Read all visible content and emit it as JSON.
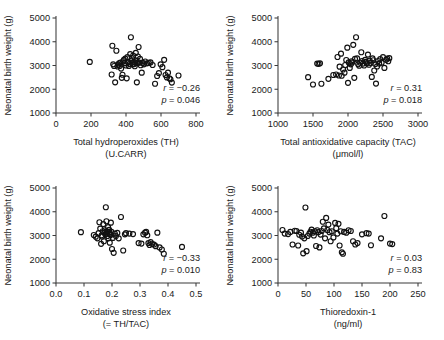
{
  "figure": {
    "background": "#ffffff",
    "marker_color": "#111111",
    "axis_color": "#3b3b3b",
    "shared_ylabel": "Neonatal birth weight (g)"
  },
  "chart_data": [
    {
      "type": "scatter",
      "panel_id": "panel-th",
      "title": "",
      "xlabel": "Total hydroperoxides (TH)",
      "xlabel_line2": "(U.CARR)",
      "ylabel": "Neonatal birth weight (g)",
      "xlim": [
        0,
        800
      ],
      "ylim": [
        1000,
        5000
      ],
      "xticks": [
        0,
        200,
        400,
        600,
        800
      ],
      "xtick_labels": [
        "0",
        "200",
        "400",
        "600",
        "800"
      ],
      "yticks": [
        1000,
        2000,
        3000,
        4000,
        5000
      ],
      "ytick_labels": [
        "1000",
        "2000",
        "3000",
        "4000",
        "5000"
      ],
      "grid": false,
      "legend": "none",
      "annotations": {
        "r_label": "r",
        "r_value": "= −0.26",
        "p_label": "p",
        "p_value": "= 0.046"
      },
      "statistics": {
        "r": -0.26,
        "p": 0.046,
        "n": 60
      },
      "x": [
        193,
        318,
        322,
        327,
        332,
        338,
        345,
        352,
        356,
        360,
        364,
        368,
        372,
        376,
        380,
        384,
        388,
        392,
        396,
        400,
        404,
        408,
        412,
        416,
        420,
        424,
        428,
        430,
        434,
        438,
        441,
        444,
        447,
        450,
        453,
        456,
        459,
        462,
        465,
        468,
        472,
        476,
        480,
        484,
        490,
        496,
        502,
        510,
        520,
        530,
        540,
        552,
        566,
        578,
        588,
        598,
        608,
        618,
        626,
        634,
        640,
        648,
        654,
        662,
        700
      ],
      "y": [
        3150,
        2620,
        3830,
        3050,
        2980,
        2290,
        3620,
        2960,
        3030,
        3090,
        2980,
        3120,
        2870,
        2480,
        2610,
        3180,
        3240,
        3100,
        3290,
        3000,
        2460,
        3350,
        3130,
        2980,
        3060,
        3480,
        4190,
        3200,
        3310,
        3050,
        3420,
        3160,
        3060,
        2970,
        3120,
        3530,
        3210,
        2290,
        3100,
        3380,
        3780,
        3120,
        3280,
        3010,
        2700,
        3110,
        3050,
        3170,
        3090,
        3110,
        3130,
        3020,
        2230,
        2560,
        2680,
        3050,
        2930,
        3240,
        2600,
        2500,
        2700,
        2460,
        2420,
        2280,
        2580
      ]
    },
    {
      "type": "scatter",
      "panel_id": "panel-tac",
      "title": "",
      "xlabel": "Total antioxidative capacity (TAC)",
      "xlabel_line2": "(μmol/l)",
      "ylabel": "Neonatal birth weight (g)",
      "xlim": [
        1000,
        3000
      ],
      "ylim": [
        1000,
        5000
      ],
      "xticks": [
        1000,
        1500,
        2000,
        2500,
        3000
      ],
      "xtick_labels": [
        "1000",
        "1500",
        "2000",
        "2500",
        "3000"
      ],
      "yticks": [
        1000,
        2000,
        3000,
        4000,
        5000
      ],
      "ytick_labels": [
        "1000",
        "2000",
        "3000",
        "4000",
        "5000"
      ],
      "grid": false,
      "legend": "none",
      "annotations": {
        "r_label": "r",
        "r_value": "= 0.31",
        "p_label": "p",
        "p_value": "= 0.018"
      },
      "statistics": {
        "r": 0.31,
        "p": 0.018,
        "n": 60
      },
      "x": [
        1430,
        1500,
        1560,
        1580,
        1600,
        1620,
        1720,
        1790,
        1830,
        1850,
        1870,
        1880,
        1900,
        1910,
        1930,
        1950,
        1960,
        1975,
        1990,
        2000,
        2010,
        2025,
        2040,
        2050,
        2060,
        2075,
        2090,
        2100,
        2115,
        2130,
        2145,
        2160,
        2175,
        2190,
        2200,
        2215,
        2230,
        2245,
        2255,
        2270,
        2285,
        2300,
        2310,
        2325,
        2340,
        2350,
        2360,
        2375,
        2390,
        2400,
        2415,
        2430,
        2445,
        2460,
        2480,
        2500,
        2520,
        2545,
        2560,
        2575,
        2590
      ],
      "y": [
        2510,
        2200,
        3080,
        3070,
        3090,
        2230,
        2440,
        2600,
        2620,
        3360,
        2580,
        2950,
        3500,
        2570,
        2830,
        2700,
        3020,
        3230,
        3750,
        2270,
        3130,
        2900,
        3050,
        3180,
        3130,
        3870,
        2480,
        3280,
        4190,
        3300,
        3050,
        2990,
        3120,
        3560,
        3190,
        3080,
        3000,
        3240,
        3150,
        3100,
        3460,
        3030,
        3200,
        3110,
        2520,
        3300,
        3220,
        2790,
        3060,
        2240,
        2960,
        3190,
        3080,
        3270,
        3120,
        3350,
        2900,
        3240,
        3290,
        3180,
        3310
      ]
    },
    {
      "type": "scatter",
      "panel_id": "panel-osi",
      "title": "",
      "xlabel": "Oxidative stress index",
      "xlabel_line2": "(= TH/TAC)",
      "ylabel": "Neonatal birth weight (g)",
      "xlim": [
        0.0,
        0.5
      ],
      "ylim": [
        1000,
        5000
      ],
      "xticks": [
        0.0,
        0.1,
        0.2,
        0.3,
        0.4,
        0.5
      ],
      "xtick_labels": [
        "0.0",
        "0.1",
        "0.2",
        "0.3",
        "0.4",
        "0.5"
      ],
      "yticks": [
        1000,
        2000,
        3000,
        4000,
        5000
      ],
      "ytick_labels": [
        "1000",
        "2000",
        "3000",
        "4000",
        "5000"
      ],
      "grid": false,
      "legend": "none",
      "annotations": {
        "r_label": "r",
        "r_value": "= −0.33",
        "p_label": "p",
        "p_value": "= 0.010"
      },
      "statistics": {
        "r": -0.33,
        "p": 0.01,
        "n": 60
      },
      "x": [
        0.089,
        0.135,
        0.142,
        0.148,
        0.152,
        0.155,
        0.158,
        0.161,
        0.163,
        0.165,
        0.167,
        0.169,
        0.171,
        0.173,
        0.175,
        0.176,
        0.178,
        0.18,
        0.181,
        0.183,
        0.184,
        0.186,
        0.187,
        0.189,
        0.19,
        0.192,
        0.193,
        0.195,
        0.196,
        0.198,
        0.2,
        0.203,
        0.206,
        0.21,
        0.214,
        0.219,
        0.224,
        0.232,
        0.24,
        0.246,
        0.25,
        0.262,
        0.275,
        0.295,
        0.305,
        0.312,
        0.318,
        0.322,
        0.326,
        0.33,
        0.334,
        0.338,
        0.344,
        0.35,
        0.356,
        0.362,
        0.37,
        0.378,
        0.385,
        0.45
      ],
      "y": [
        3140,
        3020,
        2950,
        2880,
        3100,
        3560,
        3290,
        2650,
        3010,
        2960,
        3180,
        3480,
        2760,
        3120,
        3220,
        3050,
        4190,
        3600,
        3090,
        3170,
        2980,
        3350,
        2880,
        3120,
        3240,
        2700,
        3060,
        3020,
        3540,
        3150,
        2430,
        2900,
        2270,
        3080,
        2980,
        3110,
        2880,
        3780,
        2370,
        3050,
        3100,
        3080,
        3060,
        2680,
        2660,
        3050,
        3120,
        3150,
        3010,
        2680,
        2600,
        2720,
        2640,
        2620,
        2550,
        3120,
        2500,
        2410,
        2230,
        2520
      ]
    },
    {
      "type": "scatter",
      "panel_id": "panel-trx",
      "title": "",
      "xlabel": "Thioredoxin-1",
      "xlabel_line2": "(ng/ml)",
      "ylabel": "Neonatal birth weight (g)",
      "xlim": [
        0,
        250
      ],
      "ylim": [
        1000,
        5000
      ],
      "xticks": [
        0,
        50,
        100,
        150,
        200,
        250
      ],
      "xtick_labels": [
        "0",
        "50",
        "100",
        "150",
        "200",
        "250"
      ],
      "yticks": [
        1000,
        2000,
        3000,
        4000,
        5000
      ],
      "ytick_labels": [
        "1000",
        "2000",
        "3000",
        "4000",
        "5000"
      ],
      "grid": false,
      "legend": "none",
      "annotations": {
        "r_label": "r",
        "r_value": "= 0.03",
        "p_label": "p",
        "p_value": "= 0.83"
      },
      "statistics": {
        "r": 0.03,
        "p": 0.83,
        "n": 60
      },
      "x": [
        8,
        12,
        18,
        22,
        26,
        30,
        33,
        36,
        38,
        41,
        43,
        45,
        47,
        49,
        51,
        53,
        56,
        58,
        60,
        62,
        64,
        66,
        68,
        70,
        72,
        74,
        76,
        78,
        80,
        82,
        84,
        86,
        88,
        90,
        92,
        94,
        96,
        99,
        102,
        104,
        106,
        108,
        110,
        112,
        114,
        116,
        118,
        122,
        126,
        130,
        134,
        138,
        142,
        150,
        158,
        162,
        166,
        184,
        190,
        200,
        204
      ],
      "y": [
        3230,
        3080,
        3060,
        3150,
        2620,
        3200,
        3190,
        2580,
        3030,
        3120,
        2960,
        2250,
        2880,
        4180,
        2340,
        2980,
        3080,
        3160,
        3250,
        3120,
        3000,
        3180,
        2560,
        3220,
        3140,
        2500,
        3040,
        3190,
        3580,
        3300,
        2880,
        3740,
        3230,
        3460,
        3140,
        2760,
        3180,
        2920,
        3530,
        3310,
        3080,
        3490,
        2580,
        3180,
        2290,
        2230,
        3150,
        3120,
        3220,
        3190,
        2760,
        2620,
        2680,
        3050,
        3100,
        3080,
        2590,
        2880,
        3820,
        2660,
        2640
      ]
    }
  ]
}
